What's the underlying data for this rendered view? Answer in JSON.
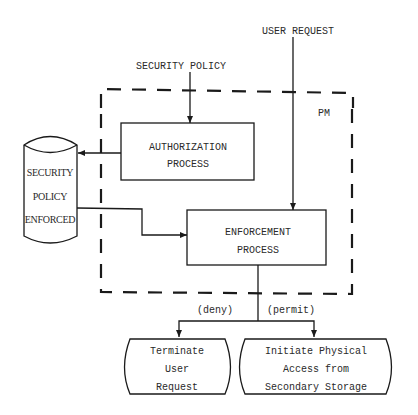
{
  "diagram": {
    "inputs": {
      "user_request": "USER REQUEST",
      "security_policy": "SECURITY POLICY"
    },
    "boundary": {
      "label": "PM",
      "style": "dashed"
    },
    "processes": {
      "authorization": [
        "AUTHORIZATION",
        "PROCESS"
      ],
      "enforcement": [
        "ENFORCEMENT",
        "PROCESS"
      ]
    },
    "store": {
      "lines": [
        "SECURITY",
        "POLICY",
        "ENFORCED"
      ]
    },
    "branches": {
      "deny": "(deny)",
      "permit": "(permit)"
    },
    "outcomes": {
      "terminate": [
        "Terminate",
        "User",
        "Request"
      ],
      "initiate": [
        "Initiate Physical",
        "Access from",
        "Secondary Storage"
      ]
    },
    "colors": {
      "ink": "#1a1a1a",
      "background": "#ffffff"
    }
  }
}
